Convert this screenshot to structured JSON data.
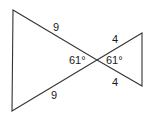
{
  "diagram": {
    "type": "bowtie-triangles",
    "stroke_color": "#333333",
    "left_triangle": {
      "side_top_label": "9",
      "side_bottom_label": "9",
      "angle_label": "61°"
    },
    "right_triangle": {
      "side_top_label": "4",
      "side_bottom_label": "4",
      "angle_label": "61°"
    }
  }
}
